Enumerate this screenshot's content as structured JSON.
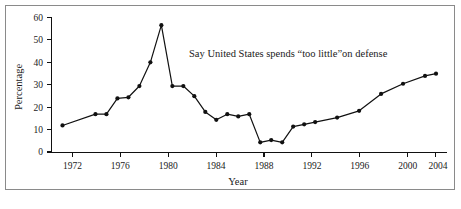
{
  "chart_data": {
    "type": "line",
    "title": "",
    "subtitle": "",
    "xlabel": "Year",
    "ylabel": "Percentage",
    "annotation": "Say United States spends “too little”on defense",
    "xlim": [
      1970,
      2006
    ],
    "ylim": [
      0,
      60
    ],
    "grid": false,
    "legend": false,
    "xticks": [
      1972,
      1976,
      1980,
      1984,
      1988,
      1992,
      1996,
      2000,
      2004
    ],
    "xtick_labels": [
      "1972",
      "1976",
      "1980",
      "1984",
      "1988",
      "1992",
      "1996",
      "2000",
      "2004"
    ],
    "yticks": [
      0,
      10,
      20,
      30,
      40,
      50,
      60
    ],
    "ytick_labels": [
      "0",
      "10",
      "20",
      "30",
      "40",
      "50",
      "60"
    ],
    "marker": "filled-circle",
    "line_color": "#111111",
    "series": [
      {
        "name": "Say United States spends too little on defense",
        "x": [
          1971,
          1974,
          1975,
          1976,
          1977,
          1978,
          1979,
          1980,
          1981,
          1982,
          1983,
          1984,
          1985,
          1986,
          1987,
          1988,
          1989,
          1990,
          1991,
          1992,
          1993,
          1994,
          1996,
          1998,
          2000,
          2002,
          2004,
          2005
        ],
        "values": [
          12,
          17,
          17,
          24,
          24.5,
          29.5,
          40,
          56.5,
          29.5,
          29.5,
          25,
          18,
          14.5,
          17,
          16,
          17,
          4.5,
          5.5,
          4.5,
          11.5,
          12.5,
          13.5,
          15.5,
          18.5,
          26,
          30.5,
          34,
          35
        ]
      }
    ]
  },
  "axes": {
    "ylabel_text": "Percentage",
    "xlabel_text": "Year"
  }
}
